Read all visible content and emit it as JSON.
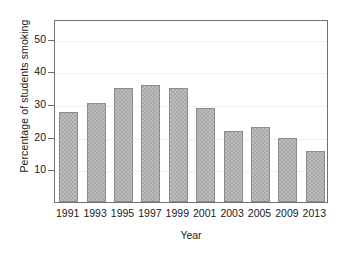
{
  "chart_data": {
    "type": "bar",
    "title": "",
    "subtitle": "",
    "xlabel": "Year",
    "ylabel": "Percentage of students smoking",
    "categories": [
      "1991",
      "1993",
      "1995",
      "1997",
      "1999",
      "2001",
      "2003",
      "2005",
      "2009",
      "2013"
    ],
    "values": [
      27.5,
      30.3,
      34.8,
      35.7,
      34.8,
      28.7,
      21.7,
      22.9,
      19.5,
      15.5
    ],
    "series": [
      {
        "name": "Percentage of students smoking",
        "values": [
          27.5,
          30.3,
          34.8,
          35.7,
          34.8,
          28.7,
          21.7,
          22.9,
          19.5,
          15.5
        ]
      }
    ],
    "ylim": [
      0,
      56
    ],
    "yticks": [
      10,
      20,
      30,
      40,
      50
    ],
    "ytick_labels": [
      "10",
      "20",
      "30",
      "40",
      "50"
    ],
    "xlim_categories": 10,
    "grid": "horizontal",
    "gridlines_at": [
      10,
      20,
      30,
      40,
      50
    ],
    "legend": "none",
    "legend_position": "none",
    "bar_color": "#a9a9a9",
    "bar_edge_color": "#8c8c8c",
    "grid_color": "#f0f0f0",
    "axis_color": "#6f6f6f",
    "text_color": "#1a1a1a",
    "background": "#ffffff"
  },
  "axes": {
    "y_title": "Percentage of students smoking",
    "x_title": "Year"
  }
}
